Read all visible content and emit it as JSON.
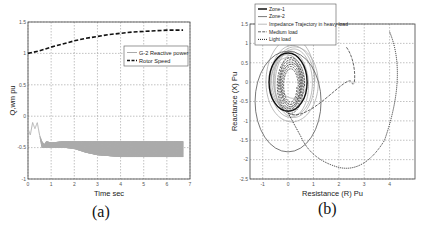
{
  "figure": {
    "captions": [
      "(a)",
      "(b)"
    ]
  },
  "chart_data": [
    {
      "type": "line",
      "panel": "(a)",
      "title": "",
      "xlabel": "Time sec",
      "ylabel": "Q,wm pu",
      "xlim": [
        0,
        7
      ],
      "ylim": [
        -1,
        1.5
      ],
      "xticks": [
        "0",
        "1",
        "2",
        "3",
        "4",
        "5",
        "6",
        "7"
      ],
      "yticks": [
        "-1",
        "-0.5",
        "0",
        "0.5",
        "1",
        "1.5"
      ],
      "grid": true,
      "legend_position": "upper right (inside)",
      "legend": [
        "G-2 Reactive power",
        "Rotor Speed"
      ],
      "series": [
        {
          "name": "Rotor Speed",
          "style": "black dashed",
          "x": [
            0,
            0.5,
            1,
            1.5,
            2,
            2.5,
            3,
            3.5,
            4,
            4.5,
            5,
            5.5,
            6,
            6.5,
            6.7
          ],
          "y": [
            1.0,
            1.04,
            1.1,
            1.15,
            1.2,
            1.24,
            1.27,
            1.3,
            1.32,
            1.34,
            1.35,
            1.36,
            1.37,
            1.37,
            1.37
          ]
        },
        {
          "name": "G-2 Reactive power",
          "style": "gray solid, high-frequency oscillation (filled band)",
          "x": [
            0,
            0.1,
            0.2,
            0.3,
            0.4,
            0.5,
            0.6,
            0.7,
            0.8,
            1.0,
            1.5,
            2.0,
            2.5,
            3.0,
            4.0,
            5.0,
            6.0,
            6.7
          ],
          "y_upper": [
            -0.2,
            -0.3,
            -0.1,
            -0.2,
            -0.1,
            -0.3,
            -0.4,
            -0.45,
            -0.4,
            -0.42,
            -0.4,
            -0.4,
            -0.4,
            -0.4,
            -0.4,
            -0.4,
            -0.4,
            -0.4
          ],
          "y_lower": [
            -0.2,
            -0.3,
            -0.1,
            -0.2,
            -0.1,
            -0.3,
            -0.5,
            -0.5,
            -0.5,
            -0.5,
            -0.5,
            -0.52,
            -0.58,
            -0.62,
            -0.65,
            -0.65,
            -0.65,
            -0.65
          ]
        }
      ]
    },
    {
      "type": "line",
      "panel": "(b)",
      "title": "",
      "xlabel": "Resistance (R) Pu",
      "ylabel": "Reactance (X) Pu",
      "xlim": [
        -1.5,
        5
      ],
      "ylim": [
        -2.5,
        1.5
      ],
      "xticks": [
        "-1",
        "0",
        "1",
        "2",
        "3",
        "4"
      ],
      "yticks": [
        "-2.5",
        "-2",
        "-1.5",
        "-1",
        "-0.5",
        "0",
        "0.5",
        "1",
        "1.5"
      ],
      "grid": true,
      "legend_position": "upper left (overlapping top)",
      "legend": [
        "Zone-1",
        "Zone-2",
        "Impedance Trajectory in heavy load",
        "Medium load",
        "Light load"
      ],
      "series": [
        {
          "name": "Zone-1",
          "style": "black thick solid",
          "shape": "mho circle",
          "center": [
            0.0,
            0.0
          ],
          "radius": 0.75
        },
        {
          "name": "Zone-2",
          "style": "dark gray solid",
          "shape": "mho circle",
          "center": [
            0.0,
            -0.5
          ],
          "radius": 1.3
        },
        {
          "name": "Impedance Trajectory in heavy load",
          "style": "light gray solid",
          "shape": "spiral loops",
          "center": [
            0.1,
            0.0
          ],
          "extent_x": [
            -0.8,
            1.6
          ],
          "extent_y": [
            -1.0,
            1.1
          ]
        },
        {
          "name": "Medium load",
          "style": "gray dashed",
          "shape": "arc",
          "points": [
            [
              2.3,
              0.9
            ],
            [
              2.5,
              0.0
            ],
            [
              1.9,
              -1.0
            ],
            [
              0.0,
              -0.8
            ]
          ]
        },
        {
          "name": "Light load",
          "style": "black dotted",
          "shape": "arc",
          "points": [
            [
              4.0,
              1.3
            ],
            [
              4.4,
              0.0
            ],
            [
              3.8,
              -1.5
            ],
            [
              2.0,
              -2.2
            ],
            [
              0.5,
              -1.4
            ],
            [
              0.0,
              -0.8
            ]
          ]
        }
      ]
    }
  ]
}
